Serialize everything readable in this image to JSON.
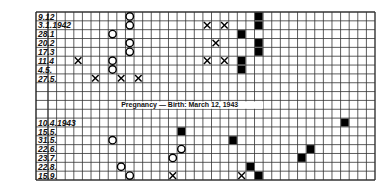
{
  "chart_data": {
    "type": "table",
    "title": "",
    "annotation": "Pregnancy — Birth: March 12, 1943",
    "columns": 38,
    "rows": [
      {
        "label": "9.12",
        "marks": [
          {
            "col": 9,
            "type": "circle"
          },
          {
            "col": 24,
            "type": "filled"
          }
        ]
      },
      {
        "label": "3.1.1942",
        "marks": [
          {
            "col": 9,
            "type": "circle"
          },
          {
            "col": 18,
            "type": "cross"
          },
          {
            "col": 20,
            "type": "cross"
          },
          {
            "col": 24,
            "type": "filled"
          }
        ]
      },
      {
        "label": "28.1",
        "marks": [
          {
            "col": 7,
            "type": "circle"
          },
          {
            "col": 22,
            "type": "filled"
          }
        ]
      },
      {
        "label": "20.2",
        "marks": [
          {
            "col": 9,
            "type": "circle"
          },
          {
            "col": 19,
            "type": "cross"
          },
          {
            "col": 24,
            "type": "filled"
          }
        ]
      },
      {
        "label": "17.3",
        "marks": [
          {
            "col": 9,
            "type": "circle"
          },
          {
            "col": 24,
            "type": "filled"
          }
        ]
      },
      {
        "label": "11.4",
        "marks": [
          {
            "col": 3,
            "type": "cross"
          },
          {
            "col": 7,
            "type": "circle"
          },
          {
            "col": 18,
            "type": "cross"
          },
          {
            "col": 20,
            "type": "cross"
          },
          {
            "col": 22,
            "type": "filled"
          }
        ]
      },
      {
        "label": "4.5.",
        "marks": [
          {
            "col": 7,
            "type": "circle"
          },
          {
            "col": 22,
            "type": "filled"
          }
        ]
      },
      {
        "label": "27.5.",
        "marks": [
          {
            "col": 5,
            "type": "cross"
          },
          {
            "col": 8,
            "type": "cross"
          },
          {
            "col": 10,
            "type": "cross"
          }
        ]
      },
      {
        "label": "",
        "marks": []
      },
      {
        "label": "",
        "marks": []
      },
      {
        "label": "",
        "marks": [],
        "annotation_row": true
      },
      {
        "label": "",
        "marks": []
      },
      {
        "label": "10.4.1943",
        "marks": [
          {
            "col": 34,
            "type": "filled"
          }
        ]
      },
      {
        "label": "15.5.",
        "marks": [
          {
            "col": 15,
            "type": "filled"
          }
        ]
      },
      {
        "label": "31.5.",
        "marks": [
          {
            "col": 7,
            "type": "circle"
          },
          {
            "col": 21,
            "type": "filled"
          }
        ]
      },
      {
        "label": "22.6.",
        "marks": [
          {
            "col": 15,
            "type": "circle"
          },
          {
            "col": 30,
            "type": "filled"
          }
        ]
      },
      {
        "label": "23.7.",
        "marks": [
          {
            "col": 14,
            "type": "circle"
          },
          {
            "col": 29,
            "type": "filled"
          }
        ]
      },
      {
        "label": "22.8.",
        "marks": [
          {
            "col": 8,
            "type": "circle"
          },
          {
            "col": 23,
            "type": "filled"
          }
        ]
      },
      {
        "label": "15.9.",
        "marks": [
          {
            "col": 9,
            "type": "circle"
          },
          {
            "col": 14,
            "type": "cross"
          },
          {
            "col": 22,
            "type": "cross"
          },
          {
            "col": 24,
            "type": "filled"
          }
        ]
      }
    ],
    "legend": {
      "circle": "O",
      "cross": "X",
      "filled": "■"
    }
  }
}
